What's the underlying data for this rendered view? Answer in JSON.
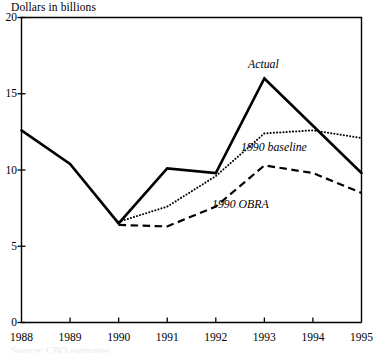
{
  "figure": {
    "axis_title": "Dollars in billions",
    "source_caption": "Source: CBO estimates."
  },
  "annotations": [
    {
      "name": "actual",
      "text": "Actual",
      "x": 248,
      "y": 58
    },
    {
      "name": "baseline",
      "text": "1990 baseline",
      "x": 241,
      "y": 141
    },
    {
      "name": "obra",
      "text": "1990 OBRA",
      "x": 212,
      "y": 198
    }
  ],
  "colors": {
    "ink": "#000000",
    "background": "#ffffff",
    "frame": "#000000"
  },
  "chart_data": {
    "type": "line",
    "title": "Dollars in billions",
    "xlabel": "",
    "ylabel": "Dollars in billions",
    "x": [
      1988,
      1989,
      1990,
      1991,
      1992,
      1993,
      1994,
      1995
    ],
    "categories": [
      "1988",
      "1989",
      "1990",
      "1991",
      "1992",
      "1993",
      "1994",
      "1995"
    ],
    "xlim": [
      1988,
      1995
    ],
    "ylim": [
      0,
      20
    ],
    "yticks": [
      0,
      5,
      10,
      15,
      20
    ],
    "ytick_labels": [
      "0",
      "5",
      "10",
      "15",
      "20"
    ],
    "xticks": [
      1988,
      1989,
      1990,
      1991,
      1992,
      1993,
      1994,
      1995
    ],
    "xtick_labels": [
      "1988",
      "1989",
      "1990",
      "1991",
      "1992",
      "1993",
      "1994",
      "1995"
    ],
    "grid": false,
    "legend": "inline-annotations",
    "series": [
      {
        "name": "Actual",
        "style": "solid",
        "width": 2.6,
        "color": "#000000",
        "x": [
          1988,
          1989,
          1990,
          1991,
          1992,
          1993,
          1994,
          1995
        ],
        "values": [
          12.6,
          10.4,
          6.5,
          10.1,
          9.8,
          16.0,
          12.9,
          9.8
        ]
      },
      {
        "name": "1990 baseline",
        "style": "dotted",
        "width": 2.0,
        "color": "#000000",
        "x": [
          1990,
          1991,
          1992,
          1993,
          1994,
          1995
        ],
        "values": [
          6.6,
          7.6,
          9.6,
          12.4,
          12.6,
          12.1
        ]
      },
      {
        "name": "1990 OBRA",
        "style": "dashed",
        "width": 2.2,
        "color": "#000000",
        "x": [
          1990,
          1991,
          1992,
          1993,
          1994,
          1995
        ],
        "values": [
          6.4,
          6.3,
          7.6,
          10.3,
          9.8,
          8.5
        ]
      }
    ]
  }
}
